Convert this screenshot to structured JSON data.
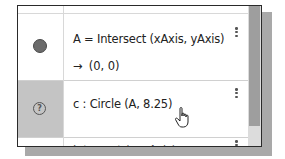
{
  "algebra_view": {
    "rows": [
      {
        "icon": "filled-circle-icon",
        "icon_color": "#6b6b6b",
        "command": "A = Intersect (xAxis, yAxis)",
        "result_arrow": "→",
        "result": "(0, 0)",
        "menu_icon": "more-vert-icon"
      },
      {
        "icon": "help-icon",
        "icon_glyph": "?",
        "highlighted": true,
        "command": "c : Circle (A, 8.25)",
        "menu_icon": "more-vert-icon"
      },
      {
        "partial": true,
        "command": "Intersect (c, xAxis)",
        "menu_icon": "more-vert-icon"
      }
    ],
    "cursor": "hand-pointer-icon"
  },
  "colors": {
    "highlight_bg": "#c4c4c4",
    "scrollbar_thumb": "#9e9e9e",
    "border": "#2a2a2a"
  }
}
